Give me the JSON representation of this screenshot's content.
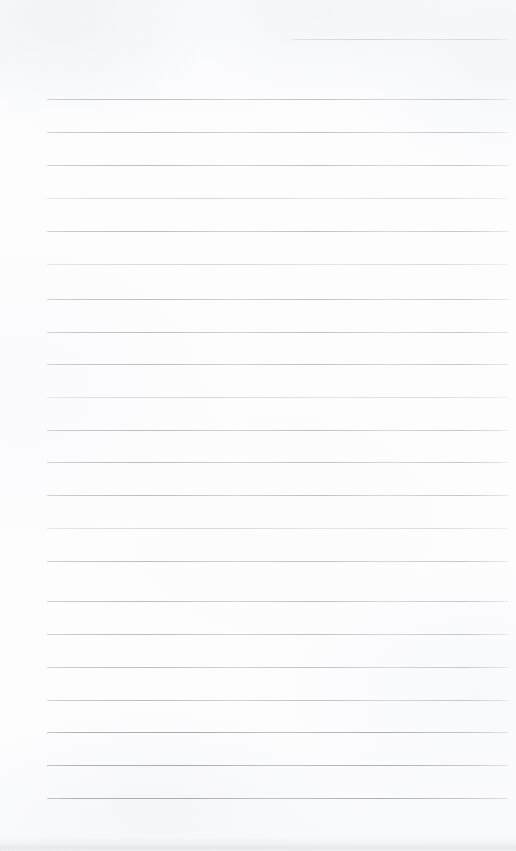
{
  "document": {
    "kind": "ruled-paper-scan",
    "title": "Blank lined notebook page",
    "page_width": 516,
    "page_height": 851,
    "background_color": "#fdfdfe",
    "rule_color": "#b9bdc4",
    "rule_thickness_px": 1,
    "rule_spacing_px": 32.7,
    "content_text": "",
    "writing_present": "none"
  },
  "rules": {
    "count": 22,
    "left_margin_px": 47,
    "right_edge_px": 508,
    "header_rule": {
      "label": "header-rule",
      "y": 39,
      "x_start": 292,
      "x_end": 508,
      "weight": "faint",
      "note": "short partial rule in upper right, like a date line"
    },
    "body_rules": [
      {
        "y": 99,
        "x_start": 47,
        "x_end": 508,
        "weight": "normal"
      },
      {
        "y": 132,
        "x_start": 47,
        "x_end": 508,
        "weight": "normal"
      },
      {
        "y": 165,
        "x_start": 47,
        "x_end": 508,
        "weight": "normal"
      },
      {
        "y": 198,
        "x_start": 47,
        "x_end": 508,
        "weight": "faint"
      },
      {
        "y": 231,
        "x_start": 47,
        "x_end": 508,
        "weight": "normal"
      },
      {
        "y": 264,
        "x_start": 47,
        "x_end": 508,
        "weight": "faint"
      },
      {
        "y": 299,
        "x_start": 47,
        "x_end": 508,
        "weight": "normal"
      },
      {
        "y": 332,
        "x_start": 47,
        "x_end": 508,
        "weight": "normal"
      },
      {
        "y": 364,
        "x_start": 47,
        "x_end": 508,
        "weight": "normal"
      },
      {
        "y": 397,
        "x_start": 47,
        "x_end": 508,
        "weight": "faint"
      },
      {
        "y": 430,
        "x_start": 47,
        "x_end": 508,
        "weight": "normal"
      },
      {
        "y": 462,
        "x_start": 47,
        "x_end": 508,
        "weight": "normal"
      },
      {
        "y": 495,
        "x_start": 47,
        "x_end": 508,
        "weight": "normal"
      },
      {
        "y": 528,
        "x_start": 47,
        "x_end": 508,
        "weight": "faint"
      },
      {
        "y": 561,
        "x_start": 47,
        "x_end": 508,
        "weight": "normal"
      },
      {
        "y": 601,
        "x_start": 47,
        "x_end": 508,
        "weight": "normal"
      },
      {
        "y": 634,
        "x_start": 47,
        "x_end": 508,
        "weight": "normal"
      },
      {
        "y": 667,
        "x_start": 47,
        "x_end": 508,
        "weight": "normal"
      },
      {
        "y": 700,
        "x_start": 47,
        "x_end": 508,
        "weight": "normal"
      },
      {
        "y": 732,
        "x_start": 47,
        "x_end": 508,
        "weight": "strong"
      },
      {
        "y": 765,
        "x_start": 47,
        "x_end": 508,
        "weight": "strong"
      },
      {
        "y": 798,
        "x_start": 47,
        "x_end": 508,
        "weight": "strong"
      }
    ]
  }
}
